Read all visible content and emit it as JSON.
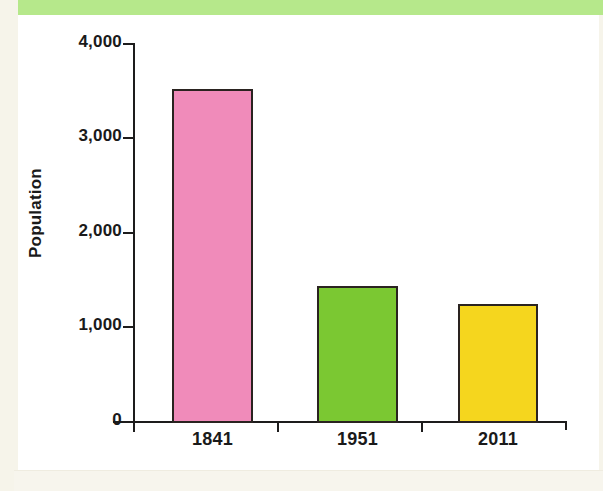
{
  "page": {
    "background_color": "#ffffff",
    "top_band_color": "#b6e88b",
    "margin_color": "#f6f4ea"
  },
  "chart_data": {
    "type": "bar",
    "title": "",
    "xlabel": "",
    "ylabel": "Population",
    "categories": [
      "1841",
      "1951",
      "2011"
    ],
    "values": [
      3530,
      1450,
      1260
    ],
    "bar_colors": [
      "#f08bba",
      "#7bc832",
      "#f5d61e"
    ],
    "bar_border_color": "#2a2320",
    "ylim": [
      0,
      4000
    ],
    "y_ticks": [
      0,
      1000,
      2000,
      3000,
      4000
    ],
    "y_tick_labels": [
      "0",
      "1,000",
      "2,000",
      "3,000",
      "4,000"
    ],
    "grid": false,
    "legend": "none"
  },
  "axis": {
    "y_title": "Population",
    "tick_0": "0",
    "tick_1000": "1,000",
    "tick_2000": "2,000",
    "tick_3000": "3,000",
    "tick_4000": "4,000",
    "cat_1": "1841",
    "cat_2": "1951",
    "cat_3": "2011"
  }
}
